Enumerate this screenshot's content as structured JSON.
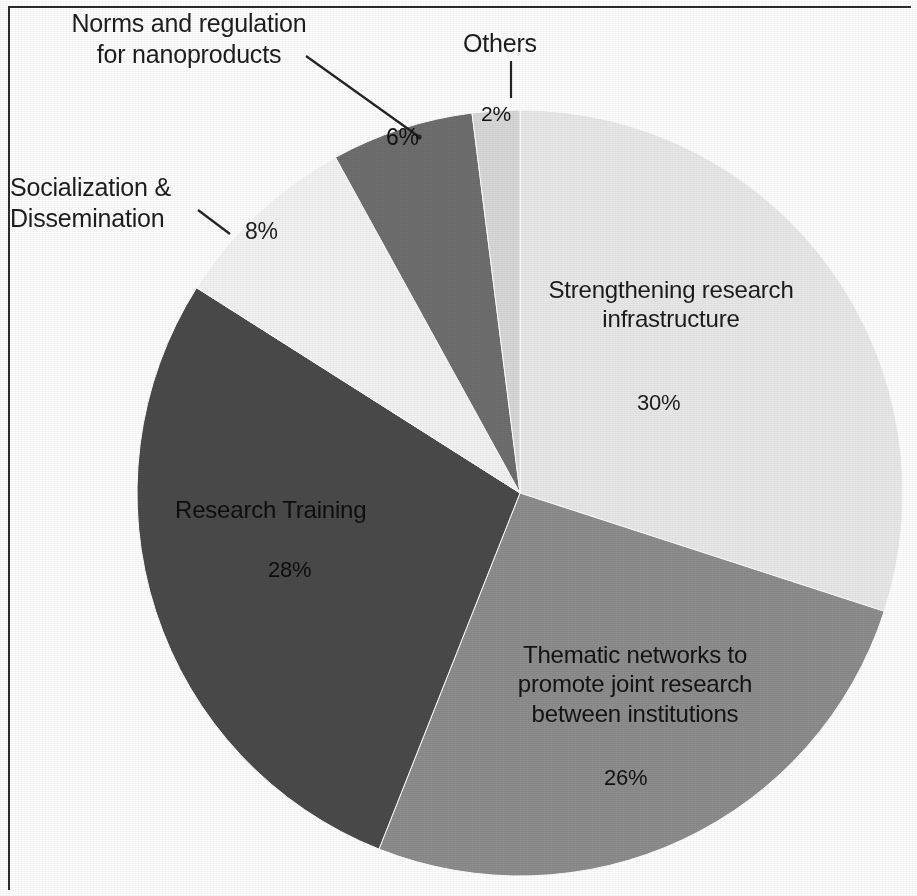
{
  "chart_data": {
    "type": "pie",
    "title": "",
    "subtitle": "",
    "xlabel": "",
    "ylabel": "",
    "legend_position": "none",
    "grid": false,
    "labels_shown_as": "callouts and in-slice labels with percentages",
    "total_percent": 100,
    "start_angle_deg": 0,
    "direction": "clockwise",
    "categories": [
      "Strengthening research infrastructure",
      "Thematic networks to promote joint research between institutions",
      "Research Training",
      "Socialization & Dissemination",
      "Norms and regulation for nanoproducts",
      "Others"
    ],
    "values": [
      30,
      26,
      28,
      8,
      6,
      2
    ],
    "value_labels": [
      "30%",
      "26%",
      "28%",
      "8%",
      "6%",
      "2%"
    ],
    "colors": [
      "#e9e9e9",
      "#8d8d8d",
      "#4a4a4a",
      "#f3f3f3",
      "#6e6e6e",
      "#d8d8d8"
    ],
    "slices": [
      {
        "name": "Strengthening research infrastructure",
        "label_line_1": "Strengthening research",
        "label_line_2": "infrastructure",
        "percent_label": "30%",
        "value": 30,
        "color": "#e9e9e9",
        "label_placement": "inside",
        "start_deg": 0,
        "end_deg": 108
      },
      {
        "name": "Thematic networks to promote joint research between institutions",
        "label_line_1": "Thematic networks to",
        "label_line_2": "promote joint research",
        "label_line_3": "between institutions",
        "percent_label": "26%",
        "value": 26,
        "color": "#8d8d8d",
        "label_placement": "inside",
        "start_deg": 108,
        "end_deg": 201.6
      },
      {
        "name": "Research Training",
        "label_line_1": "Research Training",
        "percent_label": "28%",
        "value": 28,
        "color": "#4a4a4a",
        "label_placement": "inside",
        "start_deg": 201.6,
        "end_deg": 302.4
      },
      {
        "name": "Socialization & Dissemination",
        "label_line_1": "Socialization &",
        "label_line_2": "Dissemination",
        "percent_label": "8%",
        "value": 8,
        "color": "#f3f3f3",
        "label_placement": "callout-left",
        "start_deg": 302.4,
        "end_deg": 331.2
      },
      {
        "name": "Norms and regulation for nanoproducts",
        "label_line_1": "Norms and regulation",
        "label_line_2": "for nanoproducts",
        "percent_label": "6%",
        "value": 6,
        "color": "#6e6e6e",
        "label_placement": "callout-top-left",
        "start_deg": 331.2,
        "end_deg": 352.8
      },
      {
        "name": "Others",
        "label_line_1": "Others",
        "percent_label": "2%",
        "value": 2,
        "color": "#d8d8d8",
        "label_placement": "callout-top",
        "start_deg": 352.8,
        "end_deg": 360
      }
    ]
  },
  "figure": {
    "background_color": "#ffffff",
    "border_color": "#2b2b2b",
    "text_color": "#1d1d1d"
  }
}
